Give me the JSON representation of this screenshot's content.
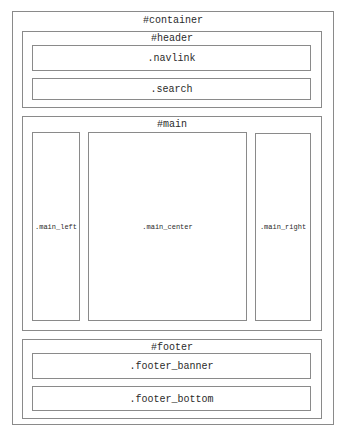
{
  "diagram": {
    "container": {
      "label": "#container"
    },
    "header": {
      "label": "#header",
      "children": [
        {
          "label": ".navlink"
        },
        {
          "label": ".search"
        }
      ]
    },
    "main": {
      "label": "#main",
      "children": [
        {
          "label": ".main_left"
        },
        {
          "label": ".main_center"
        },
        {
          "label": ".main_right"
        }
      ]
    },
    "footer": {
      "label": "#footer",
      "children": [
        {
          "label": ".footer_banner"
        },
        {
          "label": ".footer_bottom"
        }
      ]
    },
    "colors": {
      "border": "#8a8a8a",
      "text": "#2a2a2a",
      "background": "#ffffff"
    }
  }
}
